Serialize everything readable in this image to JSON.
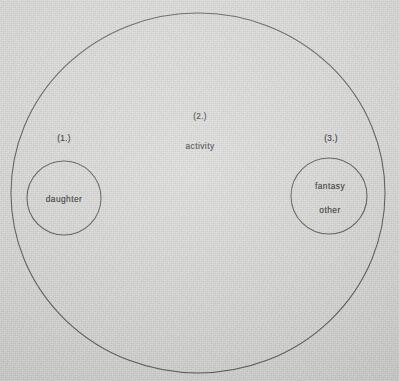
{
  "figure": {
    "type": "euler-diagram",
    "background_color": "#d3d3d1",
    "line_color": "#3a3a3a",
    "text_color": "#262626",
    "outer_set": {
      "number_label": "(2.)",
      "name_label": "activity",
      "number_label_x": 200,
      "number_label_y": 116,
      "name_label_x": 200,
      "name_label_y": 146
    },
    "subsets": [
      {
        "number_label": "(1.)",
        "name_label": "daughter",
        "number_label_x": 64,
        "number_label_y": 138,
        "name_label_x": 64,
        "name_label_y": 199,
        "circle_cx": 64,
        "circle_cy": 198,
        "circle_r": 37
      },
      {
        "number_label": "(3.)",
        "name_label_line1": "fantasy",
        "name_label_line2": "other",
        "number_label_x": 331,
        "number_label_y": 138,
        "name_label_x": 330,
        "name_label_line1_y": 186,
        "name_label_line2_y": 210,
        "circle_cx": 329,
        "circle_cy": 196,
        "circle_r": 38
      }
    ],
    "outer_ellipse": {
      "cx": 198,
      "cy": 193,
      "rx": 187,
      "ry": 180
    }
  }
}
